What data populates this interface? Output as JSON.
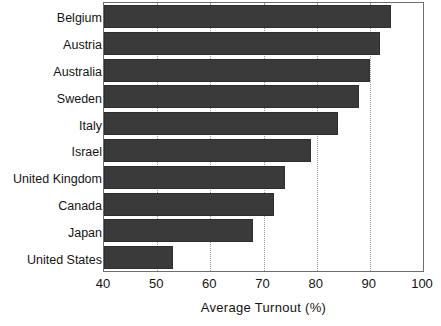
{
  "chart_data": {
    "type": "bar",
    "orientation": "horizontal",
    "title": "",
    "subtitle": "",
    "xlabel": "Average Turnout (%)",
    "ylabel": "",
    "categories": [
      "Belgium",
      "Austria",
      "Australia",
      "Sweden",
      "Italy",
      "Israel",
      "United Kingdom",
      "Canada",
      "Japan",
      "United States"
    ],
    "values": [
      94,
      92,
      90,
      88,
      84,
      79,
      74,
      72,
      68,
      53
    ],
    "xlim": [
      40,
      100
    ],
    "xticks": [
      40,
      50,
      60,
      70,
      80,
      90,
      100
    ],
    "xtick_labels": [
      "40",
      "50",
      "60",
      "70",
      "80",
      "90",
      "100"
    ],
    "grid": "vertical-dotted",
    "legend": "none",
    "bar_color": "#3a3a3a",
    "bar_edge_color": "#2e2e2e",
    "grid_color": "#9a9a9a",
    "frame_color": "#6e6e6e",
    "background_color": "#ffffff",
    "text_color": "#141414"
  }
}
